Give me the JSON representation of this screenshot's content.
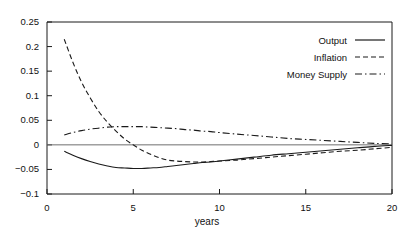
{
  "chart_data": {
    "type": "line",
    "title": "",
    "xlabel": "years",
    "ylabel": "",
    "xlim": [
      0,
      20
    ],
    "ylim": [
      -0.1,
      0.25
    ],
    "grid": false,
    "legend_position": "top-right",
    "x_ticks": [
      "0",
      "5",
      "10",
      "15",
      "20"
    ],
    "x_tick_values": [
      0,
      5,
      10,
      15,
      20
    ],
    "y_ticks": [
      "0.25",
      "0.2",
      "0.15",
      "0.1",
      "0.05",
      "0",
      "-0.05",
      "-0.1"
    ],
    "y_tick_values": [
      0.25,
      0.2,
      0.15,
      0.1,
      0.05,
      0,
      -0.05,
      -0.1
    ],
    "zero_line": 0,
    "series": [
      {
        "name": "Output",
        "style": "solid",
        "color": "#1a1a1a",
        "x": [
          1,
          1.5,
          2,
          2.5,
          3,
          3.5,
          4,
          4.5,
          5,
          5.5,
          6,
          6.5,
          7,
          7.5,
          8,
          8.5,
          9,
          9.5,
          10,
          11,
          12,
          13,
          14,
          15,
          16,
          17,
          18,
          19,
          20
        ],
        "values": [
          -0.013,
          -0.021,
          -0.028,
          -0.034,
          -0.039,
          -0.043,
          -0.046,
          -0.047,
          -0.048,
          -0.048,
          -0.047,
          -0.046,
          -0.044,
          -0.042,
          -0.04,
          -0.038,
          -0.036,
          -0.035,
          -0.033,
          -0.029,
          -0.025,
          -0.021,
          -0.018,
          -0.015,
          -0.012,
          -0.009,
          -0.006,
          -0.003,
          -0.001
        ]
      },
      {
        "name": "Inflation",
        "style": "dashed",
        "color": "#1a1a1a",
        "x": [
          1,
          1.5,
          2,
          2.5,
          3,
          3.5,
          4,
          4.5,
          5,
          5.5,
          6,
          6.5,
          7,
          7.5,
          8,
          8.5,
          9,
          9.5,
          10,
          11,
          12,
          13,
          14,
          15,
          16,
          17,
          18,
          19,
          20
        ],
        "values": [
          0.215,
          0.168,
          0.128,
          0.096,
          0.068,
          0.046,
          0.028,
          0.012,
          0.0,
          -0.011,
          -0.019,
          -0.026,
          -0.031,
          -0.033,
          -0.034,
          -0.035,
          -0.035,
          -0.034,
          -0.033,
          -0.031,
          -0.028,
          -0.025,
          -0.022,
          -0.019,
          -0.016,
          -0.013,
          -0.011,
          -0.008,
          -0.005
        ]
      },
      {
        "name": "Money Supply",
        "style": "dashdot",
        "color": "#1a1a1a",
        "x": [
          1,
          1.5,
          2,
          2.5,
          3,
          3.5,
          4,
          4.5,
          5,
          5.5,
          6,
          6.5,
          7,
          7.5,
          8,
          8.5,
          9,
          9.5,
          10,
          11,
          12,
          13,
          14,
          15,
          16,
          17,
          18,
          19,
          20
        ],
        "values": [
          0.02,
          0.025,
          0.029,
          0.032,
          0.034,
          0.036,
          0.037,
          0.037,
          0.037,
          0.037,
          0.036,
          0.035,
          0.034,
          0.033,
          0.031,
          0.03,
          0.028,
          0.027,
          0.025,
          0.022,
          0.019,
          0.016,
          0.013,
          0.011,
          0.009,
          0.007,
          0.005,
          0.003,
          0.002
        ]
      }
    ]
  },
  "legend": {
    "items": [
      {
        "label": "Output",
        "style": "solid"
      },
      {
        "label": "Inflation",
        "style": "dashed"
      },
      {
        "label": "Money Supply",
        "style": "dashdot"
      }
    ]
  },
  "axes": {
    "xlabel": "years"
  }
}
